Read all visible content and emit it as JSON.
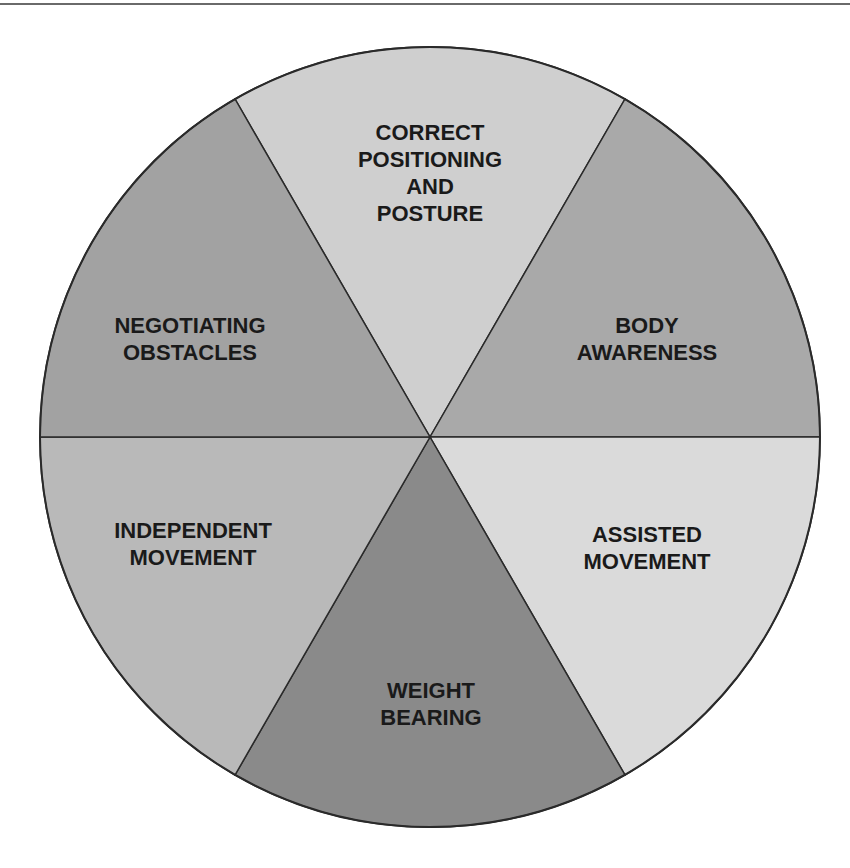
{
  "diagram": {
    "type": "segmented-wheel",
    "segment_count": 6,
    "segments": [
      {
        "id": "top",
        "lines": [
          "CORRECT",
          "POSITIONING",
          "AND",
          "POSTURE"
        ],
        "fill": "#cfcfcf"
      },
      {
        "id": "upper-right",
        "lines": [
          "BODY",
          "AWARENESS"
        ],
        "fill": "#a9a9a9"
      },
      {
        "id": "lower-right",
        "lines": [
          "ASSISTED",
          "MOVEMENT"
        ],
        "fill": "#dadada"
      },
      {
        "id": "bottom",
        "lines": [
          "WEIGHT",
          "BEARING"
        ],
        "fill": "#8a8a8a"
      },
      {
        "id": "lower-left",
        "lines": [
          "INDEPENDENT",
          "MOVEMENT"
        ],
        "fill": "#b9b9b9"
      },
      {
        "id": "upper-left",
        "lines": [
          "NEGOTIATING",
          "OBSTACLES"
        ],
        "fill": "#a2a2a2"
      }
    ],
    "colors": {
      "outline": "#2a2a2a",
      "text": "#1a1a1a",
      "background": "#ffffff",
      "top_rule": "#6a6a6a"
    }
  }
}
